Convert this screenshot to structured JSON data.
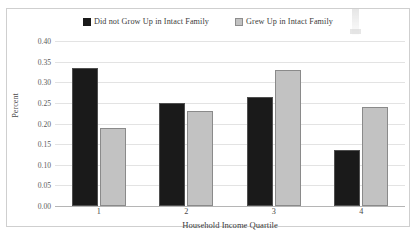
{
  "chart_data": {
    "type": "bar",
    "title": "",
    "xlabel": "Household Income Quartile",
    "ylabel": "Percent",
    "categories": [
      "1",
      "2",
      "3",
      "4"
    ],
    "series": [
      {
        "name": "Did not Grow Up in Intact Family",
        "color": "#1a1a1a",
        "values": [
          0.335,
          0.25,
          0.265,
          0.135
        ]
      },
      {
        "name": "Grew Up in Intact Family",
        "color": "#c2c2c2",
        "values": [
          0.19,
          0.23,
          0.33,
          0.24
        ]
      }
    ],
    "ylim": [
      0.0,
      0.4
    ],
    "ytick_labels": [
      "0.00",
      "0.05",
      "0.10",
      "0.15",
      "0.20",
      "0.25",
      "0.30",
      "0.35",
      "0.40"
    ],
    "ytick_values": [
      0.0,
      0.05,
      0.1,
      0.15,
      0.2,
      0.25,
      0.3,
      0.35,
      0.4
    ],
    "grid": true,
    "legend_position": "top-center"
  },
  "legend": {
    "entries": [
      {
        "label": "Did not Grow Up in Intact Family"
      },
      {
        "label": "Grew Up in Intact Family"
      }
    ]
  }
}
